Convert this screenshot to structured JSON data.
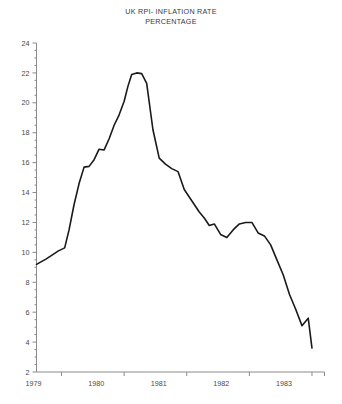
{
  "chart_data": {
    "type": "line",
    "title": "UK RPI- INFLATION RATE PERCENTAGE",
    "title_lines": [
      "UK RPI- INFLATION RATE",
      "PERCENTAGE"
    ],
    "xlabel": "",
    "ylabel": "",
    "ylim": [
      2,
      24
    ],
    "xlim": [
      1978.6,
      1983.2
    ],
    "grid": false,
    "legend": null,
    "y_ticks": [
      2,
      4,
      6,
      8,
      10,
      12,
      14,
      16,
      18,
      20,
      22,
      24
    ],
    "y_minor_step": 0.5,
    "x_ticks": [
      1979.0,
      1980.0,
      1981.0,
      1982.0,
      1983.0
    ],
    "x_tick_labels": [
      "1979",
      "1980",
      "1981",
      "1982",
      "1983"
    ],
    "line_color": "#1a1a1a",
    "axis_color": "#8a8a8a",
    "series": [
      {
        "name": "UK RPI inflation rate",
        "x": [
          1978.6,
          1978.75,
          1978.86,
          1978.95,
          1979.05,
          1979.12,
          1979.2,
          1979.28,
          1979.36,
          1979.44,
          1979.52,
          1979.6,
          1979.68,
          1979.76,
          1979.84,
          1979.92,
          1980.0,
          1980.06,
          1980.12,
          1980.2,
          1980.28,
          1980.36,
          1980.46,
          1980.56,
          1980.66,
          1980.76,
          1980.86,
          1980.96,
          1981.04,
          1981.12,
          1981.2,
          1981.28,
          1981.36,
          1981.44,
          1981.54,
          1981.64,
          1981.74,
          1981.84,
          1981.94,
          1982.04,
          1982.14,
          1982.24,
          1982.34,
          1982.44,
          1982.54,
          1982.64,
          1982.74,
          1982.84,
          1982.94,
          1983.0
        ],
        "y": [
          9.2,
          9.55,
          9.85,
          10.1,
          10.3,
          11.5,
          13.2,
          14.6,
          15.7,
          15.75,
          16.2,
          16.9,
          16.85,
          17.6,
          18.5,
          19.2,
          20.1,
          21.1,
          21.9,
          22.0,
          21.95,
          21.3,
          18.2,
          16.3,
          15.9,
          15.6,
          15.4,
          14.2,
          13.7,
          13.2,
          12.7,
          12.3,
          11.8,
          11.9,
          11.2,
          11.0,
          11.5,
          11.9,
          12.0,
          12.0,
          11.3,
          11.1,
          10.5,
          9.5,
          8.5,
          7.2,
          6.2,
          5.1,
          5.6,
          3.6
        ],
        "units": "percent"
      }
    ],
    "annotations": [],
    "notable_values": {
      "start": 9.2,
      "peak": 22.0,
      "peak_x": "1980",
      "end": 3.6
    }
  }
}
